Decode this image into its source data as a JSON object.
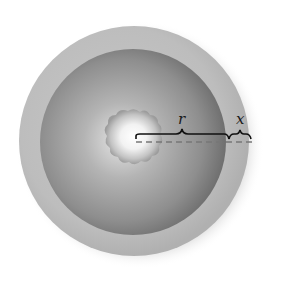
{
  "figure": {
    "labels": {
      "inner_radius": "r",
      "shell_thickness": "x"
    },
    "colors": {
      "background": "#ffffff",
      "outer_shell": "#bdbdbd",
      "inner_sphere_edge": "#7a7a7a",
      "inner_sphere_mid": "#a8a8a8",
      "core": "#ffffff",
      "core_blob": "#9a9a9a",
      "brace": "#111111",
      "dashed_line": "#777777"
    }
  }
}
